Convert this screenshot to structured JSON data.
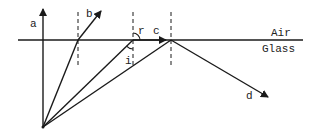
{
  "diagram": {
    "title": "",
    "media": {
      "upper": "Air",
      "lower": "Glass"
    },
    "rays": {
      "a": "a",
      "b": "b",
      "c": "c",
      "d": "d"
    },
    "angles": {
      "incidence": "i",
      "refraction": "r"
    },
    "colors": {
      "line": "#1a1a1a",
      "background": "#ffffff"
    }
  }
}
